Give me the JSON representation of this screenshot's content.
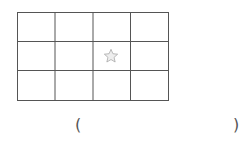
{
  "grid": {
    "rows": 3,
    "cols": 4,
    "line_color": "#555555",
    "star_cell": {
      "row": 2,
      "col": 3
    },
    "star_color": "#b0b0b0"
  },
  "answer": {
    "open": "(",
    "close": ")",
    "value": ""
  }
}
